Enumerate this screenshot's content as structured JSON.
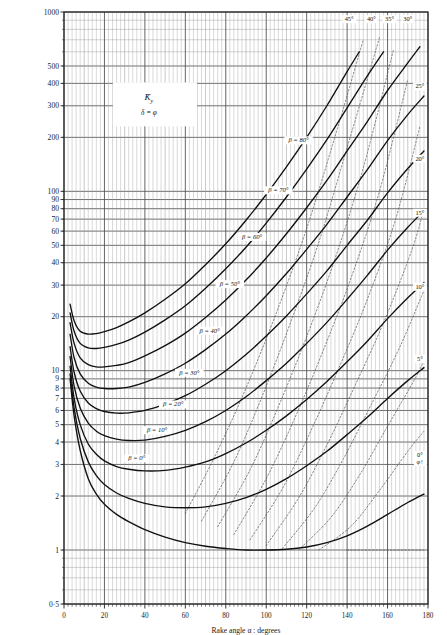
{
  "chart_data": {
    "type": "line",
    "title": "",
    "legend": {
      "symbol": "K̄",
      "symbol_sub": "y",
      "condition": "δ = φ",
      "position": "upper-left-interior"
    },
    "xlabel": "Rake angle α : degrees",
    "ylabel": "",
    "xlim": [
      0,
      180
    ],
    "ylim": [
      0.5,
      1000
    ],
    "yscale": "log",
    "xscale": "linear",
    "grid": "log-log-graph-paper",
    "xticks": [
      0,
      20,
      40,
      60,
      80,
      100,
      120,
      140,
      160,
      180
    ],
    "xticklabels": [
      "0",
      "20",
      "40",
      "60",
      "80",
      "100",
      "120",
      "140",
      "160",
      "180"
    ],
    "xminor_step": 2,
    "yticks": [
      0.5,
      1,
      2,
      3,
      4,
      5,
      6,
      7,
      8,
      9,
      10,
      20,
      30,
      40,
      50,
      60,
      70,
      80,
      90,
      100,
      200,
      300,
      400,
      500,
      1000
    ],
    "yticklabels": [
      "0·5",
      "1",
      "2",
      "3",
      "4",
      "5",
      "6",
      "7",
      "8",
      "9",
      "10",
      "20",
      "30",
      "40",
      "50",
      "60",
      "70",
      "80",
      "90",
      "100",
      "200",
      "300",
      "400",
      "500",
      "1000"
    ],
    "series": [
      {
        "name": "β = 0°",
        "label": "β = 0°",
        "style": "solid",
        "label_xy": [
          36,
          3.2
        ],
        "x": [
          3,
          5,
          8,
          12,
          16,
          20,
          26,
          32,
          40,
          50,
          60,
          70,
          80,
          90,
          100,
          110,
          120,
          130,
          140,
          150,
          160,
          170,
          178
        ],
        "y": [
          9.0,
          5.6,
          3.6,
          2.5,
          2.05,
          1.8,
          1.58,
          1.44,
          1.3,
          1.18,
          1.1,
          1.05,
          1.02,
          1.0,
          1.0,
          1.01,
          1.04,
          1.1,
          1.2,
          1.36,
          1.58,
          1.84,
          2.05
        ]
      },
      {
        "name": "β = 10°",
        "label": "β = 10°",
        "style": "solid",
        "label_xy": [
          46,
          4.6
        ],
        "x": [
          3,
          5,
          8,
          12,
          16,
          20,
          26,
          32,
          40,
          50,
          60,
          70,
          80,
          90,
          100,
          110,
          120,
          130,
          140,
          150,
          160,
          170,
          178
        ],
        "y": [
          9.6,
          6.2,
          4.2,
          3.1,
          2.6,
          2.32,
          2.08,
          1.94,
          1.82,
          1.74,
          1.72,
          1.74,
          1.82,
          1.96,
          2.18,
          2.5,
          2.95,
          3.55,
          4.4,
          5.5,
          7.0,
          8.8,
          10.4
        ]
      },
      {
        "name": "β = 20°",
        "label": "β = 20°",
        "style": "solid",
        "label_xy": [
          54,
          6.4
        ],
        "x": [
          3,
          5,
          8,
          12,
          16,
          20,
          26,
          32,
          40,
          50,
          60,
          70,
          80,
          90,
          100,
          110,
          120,
          130,
          140,
          150,
          160,
          170,
          178
        ],
        "y": [
          10.6,
          7.0,
          5.0,
          3.9,
          3.42,
          3.14,
          2.92,
          2.82,
          2.76,
          2.78,
          2.9,
          3.1,
          3.45,
          3.95,
          4.65,
          5.6,
          6.9,
          8.7,
          11.2,
          14.6,
          19.5,
          25.5,
          31.0
        ]
      },
      {
        "name": "β = 30°",
        "label": "β = 30°",
        "style": "solid",
        "label_xy": [
          62,
          9.6
        ],
        "x": [
          3,
          5,
          8,
          12,
          16,
          20,
          26,
          32,
          40,
          50,
          60,
          70,
          80,
          90,
          100,
          110,
          120,
          130,
          140,
          150,
          160,
          170,
          178
        ],
        "y": [
          12.0,
          8.2,
          6.2,
          5.1,
          4.6,
          4.34,
          4.15,
          4.08,
          4.1,
          4.3,
          4.65,
          5.2,
          6.0,
          7.15,
          8.8,
          11.0,
          14.2,
          18.6,
          25.0,
          34.0,
          47.0,
          63.0,
          78.0
        ]
      },
      {
        "name": "β = 40°",
        "label": "β = 40°",
        "style": "solid",
        "label_xy": [
          72,
          16.5
        ],
        "x": [
          3,
          5,
          8,
          12,
          16,
          20,
          26,
          32,
          40,
          50,
          60,
          70,
          80,
          90,
          100,
          110,
          120,
          130,
          140,
          150,
          160,
          170,
          178
        ],
        "y": [
          13.6,
          9.8,
          7.7,
          6.6,
          6.15,
          5.92,
          5.8,
          5.82,
          6.0,
          6.5,
          7.25,
          8.4,
          10.0,
          12.3,
          15.6,
          20.2,
          26.8,
          36.0,
          50.0,
          69.0,
          98.0,
          134.0,
          168.0
        ]
      },
      {
        "name": "β = 50°",
        "label": "β = 50°",
        "style": "solid",
        "label_xy": [
          82,
          30
        ],
        "x": [
          3,
          5,
          8,
          12,
          16,
          20,
          26,
          32,
          40,
          50,
          60,
          70,
          80,
          90,
          100,
          110,
          120,
          130,
          140,
          150,
          160,
          170,
          178
        ],
        "y": [
          16.0,
          11.8,
          9.6,
          8.5,
          8.1,
          7.95,
          7.95,
          8.1,
          8.6,
          9.6,
          11.0,
          13.1,
          16.0,
          20.2,
          26.2,
          34.8,
          47.5,
          65.5,
          93.0,
          132.0,
          192.0,
          268.0,
          340.0
        ]
      },
      {
        "name": "β = 60°",
        "label": "β = 60°",
        "style": "solid",
        "label_xy": [
          93,
          55
        ],
        "x": [
          3,
          5,
          8,
          12,
          16,
          20,
          26,
          32,
          40,
          50,
          60,
          70,
          80,
          90,
          100,
          110,
          120,
          130,
          140,
          150,
          160,
          170,
          176
        ],
        "y": [
          18.5,
          14.2,
          11.8,
          10.8,
          10.5,
          10.5,
          10.7,
          11.1,
          12.1,
          13.8,
          16.2,
          19.8,
          24.8,
          32.0,
          42.5,
          58.0,
          81.0,
          115.0,
          168.0,
          245.0,
          365.0,
          520.0,
          640.0
        ]
      },
      {
        "name": "β = 70°",
        "label": "β = 70°",
        "style": "solid",
        "label_xy": [
          106,
          100
        ],
        "x": [
          3,
          5,
          8,
          12,
          16,
          20,
          26,
          32,
          40,
          50,
          60,
          70,
          80,
          90,
          100,
          110,
          120,
          130,
          140,
          150,
          158
        ],
        "y": [
          21.0,
          16.6,
          14.2,
          13.4,
          13.3,
          13.5,
          14.0,
          14.8,
          16.4,
          19.2,
          23.0,
          28.8,
          37.0,
          48.8,
          66.5,
          93.0,
          133.0,
          194.0,
          292.0,
          440.0,
          600.0
        ]
      },
      {
        "name": "β = 80°",
        "label": "β = 80°",
        "style": "solid",
        "label_xy": [
          116,
          190
        ],
        "x": [
          3,
          5,
          8,
          12,
          16,
          20,
          26,
          32,
          40,
          50,
          60,
          70,
          80,
          90,
          100,
          110,
          120,
          130,
          140,
          146
        ],
        "y": [
          23.5,
          19.0,
          16.6,
          16.0,
          16.1,
          16.5,
          17.4,
          18.7,
          21.0,
          25.0,
          30.5,
          39.0,
          51.0,
          69.0,
          96.0,
          137.0,
          200.0,
          300.0,
          465.0,
          600.0
        ]
      }
    ],
    "phi_lines": [
      {
        "label": "45°",
        "label_xy": [
          141,
          900
        ],
        "style": "dotted",
        "x": [
          60,
          75,
          90,
          105,
          120,
          135,
          148
        ],
        "y": [
          1.6,
          3.4,
          8.0,
          21.0,
          62.0,
          220.0,
          700.0
        ]
      },
      {
        "label": "40°",
        "label_xy": [
          152,
          900
        ],
        "style": "dotted",
        "x": [
          68,
          84,
          98,
          112,
          126,
          140,
          156
        ],
        "y": [
          1.45,
          3.1,
          7.2,
          18.5,
          52.0,
          175.0,
          720.0
        ]
      },
      {
        "label": "35°",
        "label_xy": [
          161,
          900
        ],
        "style": "dotted",
        "x": [
          76,
          92,
          106,
          120,
          134,
          148,
          163
        ],
        "y": [
          1.35,
          2.8,
          6.3,
          15.5,
          42.0,
          135.0,
          620.0
        ]
      },
      {
        "label": "30°",
        "label_xy": [
          170,
          900
        ],
        "style": "dotted",
        "x": [
          84,
          100,
          114,
          128,
          142,
          156,
          170
        ],
        "y": [
          1.22,
          2.5,
          5.4,
          12.8,
          33.0,
          100.0,
          420.0
        ]
      },
      {
        "label": "25°",
        "label_xy": [
          176,
          380
        ],
        "style": "dotted",
        "x": [
          92,
          108,
          122,
          136,
          150,
          164,
          176
        ],
        "y": [
          1.14,
          2.2,
          4.6,
          10.4,
          25.0,
          70.0,
          230.0
        ]
      },
      {
        "label": "20°",
        "label_xy": [
          176,
          150
        ],
        "style": "dotted",
        "x": [
          100,
          116,
          130,
          144,
          158,
          172,
          178
        ],
        "y": [
          1.06,
          1.95,
          3.85,
          8.3,
          18.5,
          47.0,
          80.0
        ]
      },
      {
        "label": "15°",
        "label_xy": [
          176,
          75
        ],
        "style": "dotted",
        "x": [
          108,
          124,
          138,
          152,
          166,
          178
        ],
        "y": [
          1.02,
          1.72,
          3.2,
          6.5,
          13.5,
          28.0
        ]
      },
      {
        "label": "10°",
        "label_xy": [
          176,
          29
        ],
        "style": "dotted",
        "x": [
          116,
          132,
          146,
          160,
          174,
          178
        ],
        "y": [
          1.0,
          1.52,
          2.6,
          4.9,
          9.2,
          11.5
        ]
      },
      {
        "label": "5°",
        "label_xy": [
          176,
          11.5
        ],
        "style": "dotted",
        "x": [
          126,
          142,
          156,
          170,
          178
        ],
        "y": [
          1.0,
          1.36,
          2.15,
          3.55,
          4.6
        ]
      },
      {
        "label": "0°",
        "label_xy": [
          176,
          3.35
        ],
        "style": "solid-endpoint",
        "x": [
          140,
          155,
          168,
          178
        ],
        "y": [
          1.0,
          1.0,
          1.0,
          1.0
        ]
      }
    ],
    "phi_axis_note": "φ",
    "colors": {
      "curve": "#111111",
      "dotted": "#555555",
      "grid_major": "#555555",
      "grid_minor": "#9a9a9a",
      "frame": "#222222",
      "background": "#ffffff",
      "text": "#1a1a1a"
    }
  }
}
